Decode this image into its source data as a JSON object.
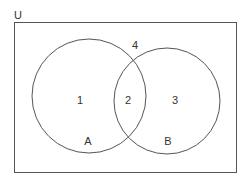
{
  "diagram": {
    "type": "venn",
    "universe": {
      "label": "U",
      "rect": {
        "x": 14.5,
        "y": 22.5,
        "width": 222,
        "height": 150
      },
      "label_pos": {
        "x": 14,
        "y": 19
      }
    },
    "sets": [
      {
        "name": "A",
        "cx": 89,
        "cy": 96,
        "r": 57,
        "label_pos": {
          "x": 88,
          "y": 145
        }
      },
      {
        "name": "B",
        "cx": 167,
        "cy": 101,
        "r": 53,
        "label_pos": {
          "x": 168,
          "y": 145
        }
      }
    ],
    "regions": [
      {
        "id": "1",
        "label": "1",
        "description": "A only",
        "pos": {
          "x": 80,
          "y": 104
        }
      },
      {
        "id": "2",
        "label": "2",
        "description": "A and B",
        "pos": {
          "x": 128,
          "y": 104
        }
      },
      {
        "id": "3",
        "label": "3",
        "description": "B only",
        "pos": {
          "x": 175,
          "y": 104
        }
      },
      {
        "id": "4",
        "label": "4",
        "description": "neither A nor B",
        "pos": {
          "x": 135,
          "y": 49
        }
      }
    ],
    "colors": {
      "stroke": "#555555",
      "text": "#333333",
      "background": "#ffffff"
    }
  }
}
